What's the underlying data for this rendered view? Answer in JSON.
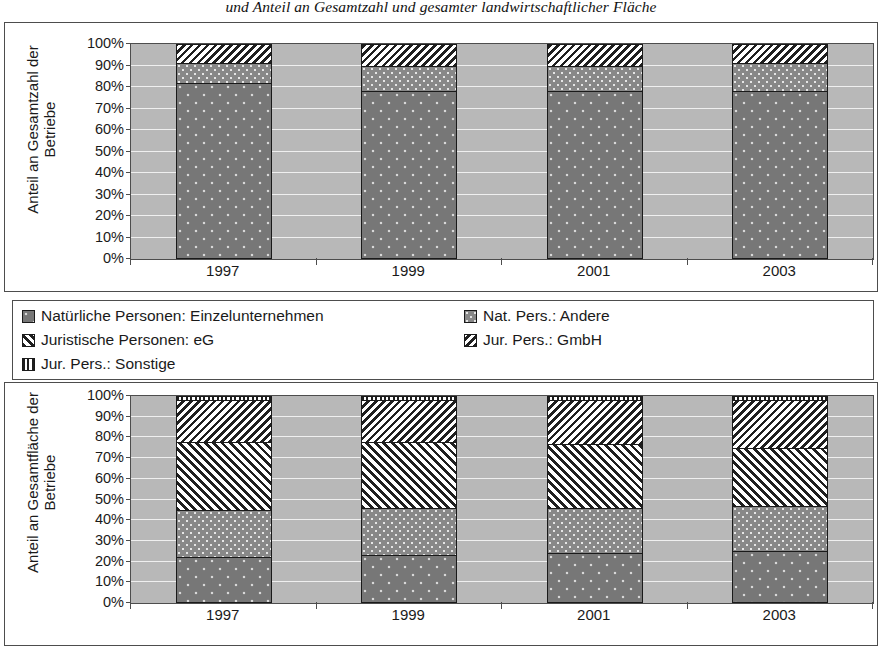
{
  "title": "und Anteil an Gesamtzahl und gesamter landwirtschaftlicher Fläche",
  "legend": {
    "items": [
      {
        "label": "Natürliche Personen: Einzelunternehmen",
        "pattern": "p-einzel",
        "key": "einzel"
      },
      {
        "label": "Nat. Pers.: Andere",
        "pattern": "p-andere",
        "key": "andere"
      },
      {
        "label": "Juristische Personen: eG",
        "pattern": "p-eg",
        "key": "eg"
      },
      {
        "label": "Jur. Pers.: GmbH",
        "pattern": "p-gmbh",
        "key": "gmbh"
      },
      {
        "label": "Jur. Pers.: Sonstige",
        "pattern": "p-sonstige",
        "key": "sonstige"
      }
    ]
  },
  "chart_data": [
    {
      "id": "top",
      "type": "bar",
      "stacked": true,
      "stack_mode": "percent",
      "title": "",
      "ylabel_lines": [
        "Anteil an Gesamtzahl der",
        "Betriebe"
      ],
      "xlabel": "",
      "categories": [
        "1997",
        "1999",
        "2001",
        "2003"
      ],
      "ticklabels": [
        "100%",
        "90%",
        "80%",
        "70%",
        "60%",
        "50%",
        "40%",
        "30%",
        "20%",
        "10%",
        "0%"
      ],
      "tickvalues": [
        100,
        90,
        80,
        70,
        60,
        50,
        40,
        30,
        20,
        10,
        0
      ],
      "ylim": [
        0,
        100
      ],
      "grid": true,
      "plot_bg": "#b8b8b8",
      "series": [
        {
          "name": "Natürliche Personen: Einzelunternehmen",
          "pattern": "p-einzel",
          "values": [
            82,
            78,
            78,
            78
          ]
        },
        {
          "name": "Nat. Pers.: Andere",
          "pattern": "p-andere",
          "values": [
            9,
            12,
            12,
            13
          ]
        },
        {
          "name": "Juristische Personen: eG",
          "pattern": "p-eg",
          "values": [
            0,
            0,
            0,
            0
          ]
        },
        {
          "name": "Jur. Pers.: GmbH",
          "pattern": "p-gmbh",
          "values": [
            9,
            10,
            10,
            9
          ]
        },
        {
          "name": "Jur. Pers.: Sonstige",
          "pattern": "p-sonstige",
          "values": [
            0,
            0,
            0,
            0
          ]
        }
      ]
    },
    {
      "id": "bottom",
      "type": "bar",
      "stacked": true,
      "stack_mode": "percent",
      "title": "",
      "ylabel_lines": [
        "Anteil an Gesamtfläche der",
        "Betriebe"
      ],
      "xlabel": "",
      "categories": [
        "1997",
        "1999",
        "2001",
        "2003"
      ],
      "ticklabels": [
        "100%",
        "90%",
        "80%",
        "70%",
        "60%",
        "50%",
        "40%",
        "30%",
        "20%",
        "10%",
        "0%"
      ],
      "tickvalues": [
        100,
        90,
        80,
        70,
        60,
        50,
        40,
        30,
        20,
        10,
        0
      ],
      "ylim": [
        0,
        100
      ],
      "grid": true,
      "plot_bg": "#b8b8b8",
      "series": [
        {
          "name": "Natürliche Personen: Einzelunternehmen",
          "pattern": "p-einzel",
          "values": [
            22,
            23,
            24,
            25
          ]
        },
        {
          "name": "Nat. Pers.: Andere",
          "pattern": "p-andere",
          "values": [
            23,
            23,
            22,
            22
          ]
        },
        {
          "name": "Juristische Personen: eG",
          "pattern": "p-eg",
          "values": [
            33,
            32,
            31,
            28
          ]
        },
        {
          "name": "Jur. Pers.: GmbH",
          "pattern": "p-gmbh",
          "values": [
            20,
            20,
            21,
            23
          ]
        },
        {
          "name": "Jur. Pers.: Sonstige",
          "pattern": "p-sonstige",
          "values": [
            2,
            2,
            2,
            2
          ]
        }
      ]
    }
  ]
}
